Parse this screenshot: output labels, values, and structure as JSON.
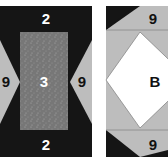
{
  "colors": {
    "black": "#151515",
    "gray": "#bdbdbd",
    "speckle": "#7d7d7d",
    "white": "#ffffff"
  },
  "left_block": {
    "top_label": "2",
    "bottom_label": "2",
    "center_label": "3",
    "left_triangle_label": "9",
    "right_triangle_label": "9"
  },
  "right_block": {
    "top_label": "9",
    "bottom_label": "9",
    "center_label": "B"
  }
}
